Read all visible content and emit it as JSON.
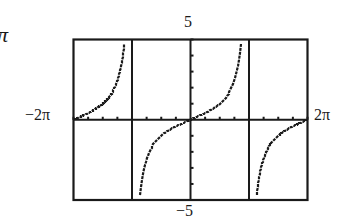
{
  "corner_glyph": "π",
  "window": {
    "xmin_label": "−2π",
    "xmax_label": "2π",
    "ymax_label": "5",
    "ymin_label": "−5"
  },
  "colors": {
    "ink": "#1a1a1a",
    "background": "#ffffff"
  },
  "chart_data": {
    "type": "line",
    "title": "",
    "function": "y = tan(x/2)",
    "xlabel": "",
    "ylabel": "",
    "xlim": [
      -6.2832,
      6.2832
    ],
    "ylim": [
      -5,
      5
    ],
    "x_tick_labels": [
      "−2π",
      "2π"
    ],
    "y_tick_labels": [
      "−5",
      "5"
    ],
    "x_tick_spacing": "π/4",
    "y_tick_spacing": 1,
    "grid": false,
    "legend": null,
    "vertical_asymptotes": [
      "−π",
      "π"
    ],
    "series": [
      {
        "name": "branch-left",
        "x": [
          -6.2832,
          -5.8905,
          -5.4978,
          -5.1051,
          -4.7124,
          -4.3197,
          -3.927,
          -3.6652,
          -3.534,
          -3.4034
        ],
        "y": [
          0.0,
          0.199,
          0.414,
          0.668,
          1.0,
          1.497,
          2.414,
          3.732,
          5.0,
          8.0
        ]
      },
      {
        "name": "branch-center",
        "x": [
          -2.7468,
          -2.618,
          -2.3562,
          -1.9635,
          -1.5708,
          -0.7854,
          0.0,
          0.7854,
          1.5708,
          1.9635,
          2.3562,
          2.618,
          2.7468
        ],
        "y": [
          -5.0,
          -3.732,
          -2.414,
          -1.497,
          -1.0,
          -0.414,
          0.0,
          0.414,
          1.0,
          1.497,
          2.414,
          3.732,
          5.0
        ]
      },
      {
        "name": "branch-right",
        "x": [
          3.4034,
          3.534,
          3.6652,
          3.927,
          4.3197,
          4.7124,
          5.1051,
          5.4978,
          5.8905,
          6.2832
        ],
        "y": [
          -8.0,
          -5.0,
          -3.732,
          -2.414,
          -1.497,
          -1.0,
          -0.668,
          -0.414,
          -0.199,
          0.0
        ]
      }
    ]
  }
}
